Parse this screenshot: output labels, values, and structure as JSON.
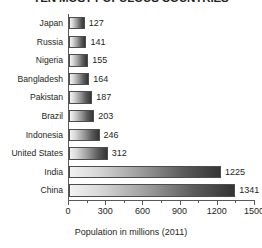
{
  "chart_data": {
    "type": "bar",
    "orientation": "horizontal",
    "title": "TEN MOST POPULOUS COUNTRIES",
    "xlabel": "Population in millions (2011)",
    "ylabel": "",
    "categories": [
      "Japan",
      "Russia",
      "Nigeria",
      "Bangladesh",
      "Pakistan",
      "Brazil",
      "Indonesia",
      "United States",
      "India",
      "China"
    ],
    "values": [
      127,
      141,
      155,
      164,
      187,
      203,
      246,
      312,
      1225,
      1341
    ],
    "value_labels": [
      "127",
      "141",
      "155",
      "164",
      "187",
      "203",
      "246",
      "312",
      "1225",
      "1341"
    ],
    "xlim": [
      0,
      1500
    ],
    "xticks": [
      0,
      300,
      600,
      900,
      1200,
      1500
    ],
    "xtick_labels": [
      "0",
      "300",
      "600",
      "900",
      "1200",
      "1500"
    ],
    "minor_xticks": [
      150,
      450,
      750,
      1050,
      1350
    ],
    "grid": false,
    "legend": null,
    "bar_fill_start_color": "#f2f2f2",
    "bar_fill_end_color": "#343434",
    "bar_outline_color": "#4d4d4d",
    "axis_color": "#58595b",
    "text_color": "#231f20",
    "background_color": "#ffffff"
  }
}
